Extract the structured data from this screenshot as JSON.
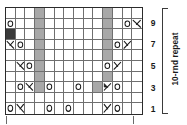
{
  "chart_data": {
    "type": "table",
    "columns": 14,
    "rows": 10,
    "row_labels": [
      "1",
      "3",
      "5",
      "7",
      "9"
    ],
    "row_label_rows": [
      1,
      3,
      5,
      7,
      9
    ],
    "repeat_label": "10-rnd repeat",
    "legend_symbols": {
      "yo": "o",
      "k2tog": "right-leaning decrease",
      "ssk": "left-leaning decrease",
      "no_stitch": "gray block",
      "solid": "dark block"
    },
    "colors": {
      "grid_line": "#6f6f6f",
      "border": "#2b2b2b",
      "no_stitch": "#a8a8a8",
      "solid": "#3a3a3a",
      "symbol": "#1a1a1a",
      "background": "#ffffff"
    },
    "grid": [
      [
        "e",
        "e",
        "e",
        "n",
        "e",
        "e",
        "e",
        "e",
        "e",
        "e",
        "n",
        "e",
        "e",
        "e"
      ],
      [
        "yo",
        "e",
        "e",
        "n",
        "e",
        "e",
        "e",
        "e",
        "e",
        "e",
        "n",
        "e",
        "yo",
        "k2tog"
      ],
      [
        "solid",
        "e",
        "e",
        "n",
        "e",
        "e",
        "e",
        "e",
        "e",
        "e",
        "n",
        "e",
        "e",
        "e"
      ],
      [
        "k2tog",
        "yo",
        "e",
        "n",
        "e",
        "e",
        "e",
        "e",
        "e",
        "e",
        "n",
        "yo",
        "ssk",
        "e"
      ],
      [
        "e",
        "e",
        "e",
        "n",
        "e",
        "e",
        "e",
        "e",
        "e",
        "e",
        "n",
        "e",
        "e",
        "e"
      ],
      [
        "e",
        "k2tog",
        "yo",
        "n",
        "e",
        "e",
        "e",
        "e",
        "e",
        "e",
        "yo",
        "ssk",
        "e",
        "e"
      ],
      [
        "e",
        "e",
        "e",
        "n",
        "e",
        "e",
        "e",
        "e",
        "e",
        "e",
        "n",
        "e",
        "e",
        "e"
      ],
      [
        "e",
        "yo",
        "k2tog",
        "n",
        "yo",
        "e",
        "e",
        "yo",
        "e",
        "n",
        "ssk",
        "yo",
        "e",
        "e"
      ],
      [
        "e",
        "e",
        "e",
        "e",
        "e",
        "e",
        "e",
        "e",
        "e",
        "e",
        "e",
        "e",
        "e",
        "e"
      ],
      [
        "yo",
        "k2tog",
        "e",
        "e",
        "yo",
        "e",
        "yo",
        "e",
        "e",
        "e",
        "ssk",
        "yo",
        "e",
        "e"
      ]
    ]
  }
}
